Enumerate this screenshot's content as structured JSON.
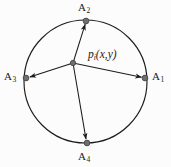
{
  "figure": {
    "type": "diagram",
    "background_color": "#fcfcfc",
    "stroke_color": "#1b1b1b",
    "node_color": "#6e6e6e"
  },
  "circle": {
    "cx": 85.5,
    "cy": 81.5,
    "r": 61.5
  },
  "center_node": {
    "name": "p-i",
    "label_text": "p",
    "label_subscript": "i",
    "label_suffix": "(x,y)",
    "x": 73,
    "y": 63
  },
  "anchors": [
    {
      "id": "A1",
      "label_text": "A",
      "label_subscript": "1",
      "x": 145,
      "y": 78
    },
    {
      "id": "A2",
      "label_text": "A",
      "label_subscript": "2",
      "x": 86,
      "y": 21
    },
    {
      "id": "A3",
      "label_text": "A",
      "label_subscript": "3",
      "x": 26,
      "y": 78
    },
    {
      "id": "A4",
      "label_text": "A",
      "label_subscript": "4",
      "x": 87,
      "y": 143
    }
  ],
  "edges": [
    {
      "from": "p-i",
      "to": "A1",
      "arrow": "to"
    },
    {
      "from": "p-i",
      "to": "A2",
      "arrow": "to"
    },
    {
      "from": "p-i",
      "to": "A3",
      "arrow": "to"
    },
    {
      "from": "p-i",
      "to": "A4",
      "arrow": "to"
    }
  ]
}
